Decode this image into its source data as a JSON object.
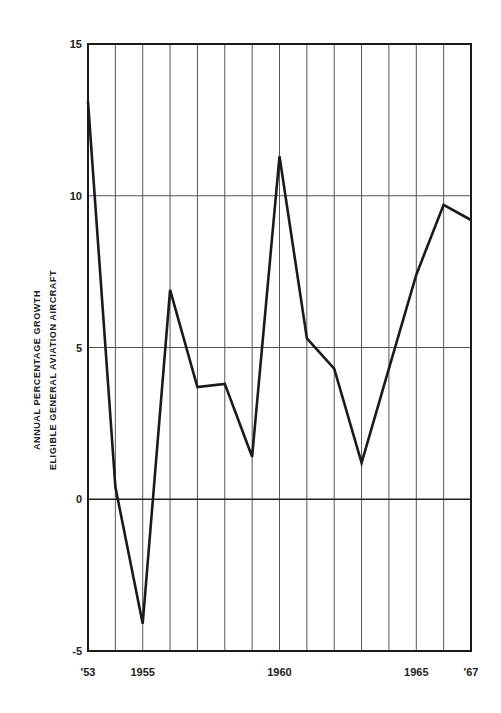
{
  "chart_data": {
    "type": "line",
    "title": "",
    "xlabel": "",
    "ylabel": "ANNUAL PERCENTAGE GROWTH ELIGIBLE GENERAL AVIATION AIRCRAFT",
    "ylabel_lines": [
      "ANNUAL PERCENTAGE GROWTH",
      "ELIGIBLE GENERAL AVIATION AIRCRAFT"
    ],
    "x": [
      1953,
      1954,
      1955,
      1956,
      1957,
      1958,
      1959,
      1960,
      1961,
      1962,
      1963,
      1964,
      1965,
      1966,
      1967
    ],
    "values": [
      13.1,
      0.4,
      -4.1,
      6.9,
      3.7,
      3.8,
      1.4,
      11.3,
      5.3,
      4.3,
      1.2,
      4.3,
      7.4,
      9.7,
      9.2
    ],
    "xlim": [
      1953,
      1967
    ],
    "ylim": [
      -5,
      15
    ],
    "x_tick_labels": [
      {
        "x": 1953,
        "label": "'53"
      },
      {
        "x": 1955,
        "label": "1955"
      },
      {
        "x": 1960,
        "label": "1960"
      },
      {
        "x": 1965,
        "label": "1965"
      },
      {
        "x": 1967,
        "label": "'67"
      }
    ],
    "y_ticks": [
      -5,
      0,
      5,
      10,
      15
    ],
    "y_tick_labels": [
      "-5",
      "0",
      "5",
      "10",
      "15"
    ],
    "grid": {
      "vertical": true,
      "horizontal": true
    },
    "legend": null,
    "line_color": "#1a1a1a"
  }
}
